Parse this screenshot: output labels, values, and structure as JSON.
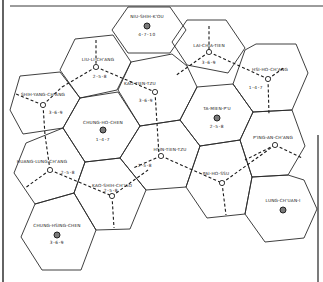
{
  "diagram": {
    "type": "hexagonal-market-area-network",
    "colors": {
      "background": "#ffffff",
      "lines": "#2a2a2a",
      "major_town_fill": "#7a7a7a",
      "minor_town_fill": "#ffffff"
    },
    "legend_note": "Filled circles = central market towns; open circles = intermediate towns; dashed lines = links to neighbouring centres",
    "towns": [
      {
        "id": "niu-shih-kou",
        "name": "NIU-SHIH-K'OU",
        "days": "4-7-10",
        "kind": "major",
        "x": 147,
        "y": 26
      },
      {
        "id": "liu-li-chang",
        "name": "LIU-LI-CH'ANG",
        "days": "2-5-8",
        "kind": "minor",
        "x": 96,
        "y": 67
      },
      {
        "id": "lai-chia-tien",
        "name": "LAI-CHIA-TIEN",
        "days": "3-6-9",
        "kind": "minor",
        "x": 209,
        "y": 52
      },
      {
        "id": "hsi-ho-chang",
        "name": "HSI-HO-CH'ANG",
        "days": "1-4-7",
        "kind": "minor",
        "x": 268,
        "y": 79
      },
      {
        "id": "kao-tien-tzu",
        "name": "KAO-TIEN-TZU",
        "days": "3-6-9",
        "kind": "minor",
        "x": 155,
        "y": 92
      },
      {
        "id": "shih-yang-chang",
        "name": "SHIH-YANG-CH'ANG",
        "days": "3-6-9",
        "kind": "minor",
        "x": 43,
        "y": 105
      },
      {
        "id": "chung-ho-chen",
        "name": "CHUNG-HO-CHEN",
        "days": "1-4-7",
        "kind": "major",
        "x": 103,
        "y": 130
      },
      {
        "id": "ta-mien-pu",
        "name": "TA-MIEN-P'U",
        "days": "2-5-8",
        "kind": "major",
        "x": 217,
        "y": 118
      },
      {
        "id": "hsin-tien-tzu",
        "name": "HSIN-TIEN-TZU",
        "days": "2-5-8",
        "kind": "minor",
        "x": 161,
        "y": 156
      },
      {
        "id": "ping-an-chang",
        "name": "P'ING-AN-CH'ANG",
        "days": "",
        "kind": "minor",
        "x": 275,
        "y": 145
      },
      {
        "id": "huang-lung-chang",
        "name": "HUANG-LUNG-CH'ANG",
        "days": "2-5-8",
        "kind": "minor",
        "x": 50,
        "y": 170
      },
      {
        "id": "kao-shih-chiao",
        "name": "KAO-SHIH-CH'IAO",
        "days": "2-5-8",
        "kind": "minor",
        "x": 112,
        "y": 196
      },
      {
        "id": "pai-ho-ssu",
        "name": "PAI-HO-SSU",
        "days": "",
        "kind": "minor",
        "x": 222,
        "y": 183
      },
      {
        "id": "chung-hsing-chen",
        "name": "CHUNG-HSING-CHEN",
        "days": "3-6-9",
        "kind": "major",
        "x": 57,
        "y": 235
      },
      {
        "id": "lung-chuan-i",
        "name": "LUNG-CH'UAN-I",
        "days": "",
        "kind": "major",
        "x": 283,
        "y": 210
      }
    ]
  }
}
